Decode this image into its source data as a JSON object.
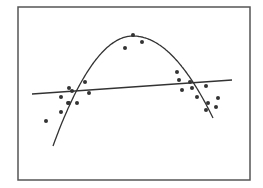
{
  "chart_data": {
    "type": "scatter",
    "title": "",
    "xlabel": "",
    "ylabel": "",
    "grid": false,
    "legend": null,
    "frame": {
      "x0": 18,
      "y0": 7,
      "x1": 250,
      "y1": 180,
      "color": "#555555"
    },
    "xlim": [
      0,
      232
    ],
    "ylim": [
      0,
      173
    ],
    "series": [
      {
        "name": "observations",
        "kind": "points",
        "color": "#333333",
        "points": [
          [
            28,
            59
          ],
          [
            43,
            83
          ],
          [
            43,
            68
          ],
          [
            50,
            77
          ],
          [
            51,
            92
          ],
          [
            54,
            89
          ],
          [
            51,
            77
          ],
          [
            59,
            77
          ],
          [
            67,
            98
          ],
          [
            71,
            87
          ],
          [
            107,
            132
          ],
          [
            115,
            145
          ],
          [
            124,
            138
          ],
          [
            159,
            108
          ],
          [
            161,
            100
          ],
          [
            164,
            90
          ],
          [
            172,
            98
          ],
          [
            174,
            92
          ],
          [
            179,
            83
          ],
          [
            188,
            94
          ],
          [
            190,
            77
          ],
          [
            200,
            82
          ],
          [
            188,
            70
          ],
          [
            198,
            73
          ]
        ]
      },
      {
        "name": "quadratic-fit",
        "kind": "curve",
        "color": "#333333",
        "apex": [
          115,
          144
        ],
        "x_range": [
          35,
          195
        ],
        "start": [
          35,
          34
        ],
        "end": [
          195,
          62
        ]
      },
      {
        "name": "linear-fit",
        "kind": "line",
        "color": "#333333",
        "start": [
          14,
          86
        ],
        "end": [
          214,
          100
        ]
      }
    ]
  }
}
